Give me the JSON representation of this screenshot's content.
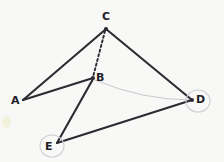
{
  "figure": {
    "background_color": "#f8f8f6",
    "ink_color": "#2b2b33",
    "faint_color": "#c9c9cc",
    "width": 224,
    "height": 162,
    "vertices": [
      {
        "id": "A",
        "label": "A",
        "x": 23,
        "y": 100,
        "label_x": 11,
        "label_y": 97,
        "dot": false
      },
      {
        "id": "B",
        "label": "B",
        "x": 93,
        "y": 78,
        "label_x": 96,
        "label_y": 74,
        "dot": true
      },
      {
        "id": "C",
        "label": "C",
        "x": 106,
        "y": 29,
        "label_x": 102,
        "label_y": 11,
        "dot": true
      },
      {
        "id": "D",
        "label": "D",
        "x": 192,
        "y": 100,
        "label_x": 196,
        "label_y": 95,
        "dot": true
      },
      {
        "id": "E",
        "label": "E",
        "x": 57,
        "y": 143,
        "label_x": 45,
        "label_y": 142,
        "dot": false
      }
    ],
    "edges": [
      {
        "id": "AC",
        "from": "A",
        "to": "C",
        "style": "solid",
        "description": "segment A to C"
      },
      {
        "id": "AB",
        "from": "A",
        "to": "B",
        "style": "solid",
        "description": "segment A to B"
      },
      {
        "id": "CB",
        "from": "C",
        "to": "B",
        "style": "dashed",
        "description": "hidden segment C to B"
      },
      {
        "id": "CD",
        "from": "C",
        "to": "D",
        "style": "solid",
        "description": "segment C to D"
      },
      {
        "id": "BE",
        "from": "B",
        "to": "E",
        "style": "solid",
        "description": "segment B to E"
      },
      {
        "id": "ED",
        "from": "E",
        "to": "D",
        "style": "solid",
        "description": "segment E to D"
      }
    ],
    "curves": [
      {
        "id": "BD",
        "from": "B",
        "to": "D",
        "style": "faint-curve",
        "control_x": 140,
        "control_y": 98,
        "description": "faint curved arc B to D"
      }
    ],
    "markers": [
      {
        "id": "circle-D",
        "around": "D",
        "cx": 198,
        "cy": 101,
        "rx": 12,
        "ry": 11
      },
      {
        "id": "circle-E",
        "around": "E",
        "cx": 52,
        "cy": 146,
        "rx": 12,
        "ry": 11
      }
    ]
  }
}
